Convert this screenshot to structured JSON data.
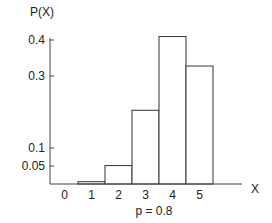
{
  "chart_data": {
    "type": "bar",
    "title": "",
    "subtitle": "p = 0.8",
    "xlabel": "X",
    "ylabel": "P(X)",
    "categories": [
      "0",
      "1",
      "2",
      "3",
      "4",
      "5"
    ],
    "values": [
      0.0003,
      0.0064,
      0.0512,
      0.2048,
      0.4096,
      0.3277
    ],
    "yticks": [
      0.05,
      0.1,
      0.3,
      0.4
    ],
    "ytick_labels": [
      "0.05",
      "0.1",
      "0.3",
      "0.4"
    ],
    "ylim": [
      0,
      0.42
    ],
    "grid": false,
    "legend": null
  },
  "labels": {
    "ylabel": "P(X)",
    "xlabel": "X",
    "caption": "p = 0.8"
  }
}
